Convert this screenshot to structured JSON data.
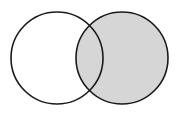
{
  "figure": {
    "name": "venn-diagram-two-sets",
    "width": 180,
    "height": 118,
    "background_color": "#ffffff",
    "stroke_color": "#1a1a1a",
    "stroke_width": 1.6,
    "shaded_fill_color": "#d6d6d6",
    "unshaded_fill_color": "#ffffff",
    "circles": [
      {
        "id": "left-circle",
        "label": "",
        "cx": 57,
        "cy": 58,
        "r": 46,
        "fill": "#ffffff",
        "shaded": false
      },
      {
        "id": "right-circle",
        "label": "",
        "cx": 122,
        "cy": 58,
        "r": 46,
        "fill": "#d6d6d6",
        "shaded": true
      }
    ],
    "regions": [
      {
        "id": "left-only",
        "shaded": false,
        "fill": "#ffffff"
      },
      {
        "id": "intersection",
        "shaded": true,
        "fill": "#d6d6d6"
      },
      {
        "id": "right-only",
        "shaded": true,
        "fill": "#d6d6d6"
      }
    ],
    "intersection_points": [
      {
        "x": 89.5,
        "y": 17
      },
      {
        "x": 89.5,
        "y": 99
      }
    ],
    "labels": []
  }
}
